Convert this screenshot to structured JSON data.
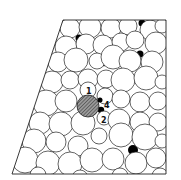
{
  "diagram": {
    "labels": [
      {
        "id": "site-1",
        "text": "1"
      },
      {
        "id": "site-4",
        "text": "4"
      },
      {
        "id": "site-2",
        "text": "2"
      }
    ],
    "highlighted_sphere": {
      "fill": "hatched-gray"
    },
    "colors": {
      "stroke": "#222222",
      "sphere_fill": "#ffffff",
      "void_fill": "#000000",
      "hatch": "#555555",
      "background": "#ffffff"
    }
  }
}
